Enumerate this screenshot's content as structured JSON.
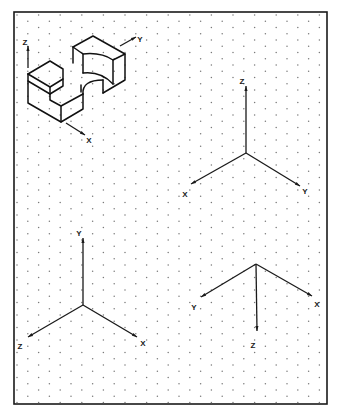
{
  "sheet": {
    "frame": {
      "x": 14,
      "y": 12,
      "width": 313,
      "height": 392
    },
    "grid": {
      "type": "isometric-dot",
      "pitch_x": 21.6,
      "pitch_y": 6.25,
      "row_offset": 10.8,
      "color": "#7a7a7a"
    }
  },
  "object": {
    "name": "isometric-block-with-semicircular-cut",
    "edges": [
      [
        [
          28,
          74
        ],
        [
          50,
          61
        ],
        [
          63,
          69
        ],
        [
          63,
          86
        ],
        [
          50,
          94
        ],
        [
          28,
          81
        ]
      ],
      [
        [
          28,
          74
        ],
        [
          50,
          87
        ],
        [
          50,
          94
        ]
      ],
      [
        [
          50,
          87
        ],
        [
          63,
          79
        ]
      ],
      [
        [
          28,
          74
        ],
        [
          28,
          103
        ],
        [
          61,
          122
        ],
        [
          83,
          109
        ],
        [
          83,
          94
        ]
      ],
      [
        [
          61,
          122
        ],
        [
          61,
          106
        ],
        [
          50,
          100
        ],
        [
          50,
          94
        ]
      ],
      [
        [
          61,
          106
        ],
        [
          83,
          94
        ]
      ],
      [
        [
          73,
          47
        ],
        [
          93,
          36
        ],
        [
          125,
          54
        ],
        [
          125,
          80
        ],
        [
          103,
          93
        ]
      ],
      [
        [
          73,
          47
        ],
        [
          73,
          63
        ]
      ],
      [
        [
          73,
          47
        ],
        [
          83,
          54
        ],
        [
          83,
          73
        ]
      ],
      [
        [
          125,
          54
        ],
        [
          113,
          60
        ],
        [
          113,
          84
        ]
      ]
    ],
    "arcs": [
      {
        "d": "M 83 54 Q 101 52 113 60"
      },
      {
        "d": "M 83 73 Q 101 71 113 84"
      },
      {
        "d": "M 83 94 Q 82 80 103 80"
      },
      {
        "d": "M 81 85 L 81 92"
      },
      {
        "d": "M 103 80 L 103 93"
      }
    ],
    "axes": [
      {
        "label": "Z",
        "from": [
          28,
          68
        ],
        "to": [
          28,
          46
        ],
        "label_pos": [
          25,
          43
        ]
      },
      {
        "label": "Y",
        "from": [
          120,
          46
        ],
        "to": [
          136,
          37
        ],
        "label_pos": [
          140,
          40
        ]
      },
      {
        "label": "X",
        "from": [
          66,
          123
        ],
        "to": [
          85,
          135
        ],
        "label_pos": [
          89,
          141
        ]
      }
    ]
  },
  "axis_systems": [
    {
      "name": "axis-system-z-up",
      "center": [
        246,
        153
      ],
      "axes": [
        {
          "label": "Z",
          "tip": [
            246,
            86
          ],
          "label_pos": [
            242,
            82
          ]
        },
        {
          "label": "X",
          "tip": [
            191,
            184
          ],
          "label_pos": [
            185,
            195
          ]
        },
        {
          "label": "Y",
          "tip": [
            300,
            186
          ],
          "label_pos": [
            305,
            192
          ]
        }
      ]
    },
    {
      "name": "axis-system-y-up",
      "center": [
        83,
        305
      ],
      "axes": [
        {
          "label": "Y",
          "tip": [
            83,
            238
          ],
          "label_pos": [
            79,
            234
          ]
        },
        {
          "label": "Z",
          "tip": [
            28,
            337
          ],
          "label_pos": [
            20,
            347
          ]
        },
        {
          "label": "X",
          "tip": [
            137,
            337
          ],
          "label_pos": [
            143,
            344
          ]
        }
      ]
    },
    {
      "name": "axis-system-z-down",
      "center": [
        256,
        264
      ],
      "axes": [
        {
          "label": "Y",
          "tip": [
            201,
            297
          ],
          "label_pos": [
            194,
            308
          ]
        },
        {
          "label": "X",
          "tip": [
            312,
            296
          ],
          "label_pos": [
            317,
            305
          ]
        },
        {
          "label": "Z",
          "tip": [
            257,
            331
          ],
          "label_pos": [
            253,
            346
          ]
        }
      ]
    }
  ]
}
